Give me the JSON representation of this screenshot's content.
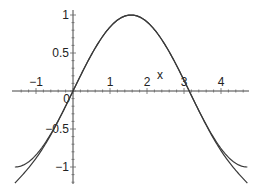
{
  "chart_data": {
    "type": "line",
    "title": "",
    "xlabel": "x",
    "ylabel": "",
    "xlim": [
      -1.5708,
      4.7124
    ],
    "ylim": [
      -1.2,
      1.0
    ],
    "grid": false,
    "legend": null,
    "x_ticks": [
      -1,
      1,
      2,
      3,
      4
    ],
    "x_tick_labels": [
      "−1",
      "1",
      "2",
      "3",
      "4"
    ],
    "y_ticks": [
      1,
      0.5,
      -0.5,
      -1
    ],
    "y_tick_labels": [
      "1",
      "0.5",
      "−0.5",
      "−1"
    ],
    "origin_label": "0",
    "series": [
      {
        "name": "sin(x)",
        "expression": "sin(x)",
        "domain": [
          -1.5708,
          4.7124
        ],
        "x": [
          -1.5708,
          -1.0,
          -0.5,
          0,
          0.5,
          1.0,
          1.5708,
          2.0,
          2.5,
          3.0,
          3.1416,
          3.5,
          4.0,
          4.7124
        ],
        "values": [
          -1.0,
          -0.841,
          -0.479,
          0.0,
          0.479,
          0.841,
          1.0,
          0.909,
          0.598,
          0.141,
          0.0,
          -0.351,
          -0.757,
          -1.0
        ]
      },
      {
        "name": "Taylor polynomial about pi/2 (degree 6)",
        "expression": "1 - (x-pi/2)^2/2 + (x-pi/2)^4/24 - (x-pi/2)^6/720",
        "domain": [
          -1.5708,
          4.7124
        ],
        "x": [
          -1.5708,
          -1.0,
          -0.5,
          0,
          0.5,
          1.0,
          1.5708,
          2.0,
          2.5,
          3.0,
          3.1416,
          3.5,
          4.0,
          4.7124
        ],
        "values": [
          -1.211,
          -0.865,
          -0.484,
          0.0,
          0.479,
          0.841,
          1.0,
          0.909,
          0.598,
          0.141,
          0.0,
          -0.355,
          -0.785,
          -1.211
        ]
      }
    ]
  }
}
